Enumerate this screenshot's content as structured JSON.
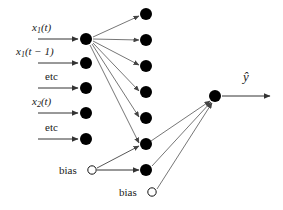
{
  "figure": {
    "type": "neural-network-diagram",
    "background_color": "#ffffff",
    "node_fill_color": "#000000",
    "bias_fill_color": "#ffffff",
    "edge_color": "#555555",
    "text_color": "#1a1a1a"
  },
  "input_layer": {
    "node_count": 5,
    "node_x": 86,
    "nodes": [
      {
        "label_main": "x",
        "label_sub": "1",
        "label_tail": "(t)",
        "y": 39,
        "arrow_from_x": 38,
        "arrow_to_x": 79,
        "label_x": 32,
        "label_y": 22
      },
      {
        "label_main": "x",
        "label_sub": "1",
        "label_tail": "(t − 1)",
        "y": 63,
        "arrow_from_x": 38,
        "arrow_to_x": 79,
        "label_x": 16,
        "label_y": 46
      },
      {
        "label_main": "etc",
        "label_sub": "",
        "label_tail": "",
        "y": 88,
        "arrow_from_x": 38,
        "arrow_to_x": 79,
        "label_x": 45,
        "label_y": 71
      },
      {
        "label_main": "x",
        "label_sub": "2",
        "label_tail": "(t)",
        "y": 113,
        "arrow_from_x": 38,
        "arrow_to_x": 79,
        "label_x": 32,
        "label_y": 96
      },
      {
        "label_main": "etc",
        "label_sub": "",
        "label_tail": "",
        "y": 139,
        "arrow_from_x": 38,
        "arrow_to_x": 79,
        "label_x": 45,
        "label_y": 122
      }
    ]
  },
  "input_bias": {
    "label": "bias",
    "x": 92,
    "y": 170,
    "radius": 4,
    "label_x": 59,
    "label_y": 165
  },
  "hidden_layer": {
    "node_count": 7,
    "node_x": 146,
    "node_y": [
      14,
      40,
      66,
      92,
      118,
      144,
      170
    ]
  },
  "output_bias": {
    "label": "bias",
    "x": 152,
    "y": 192,
    "radius": 4,
    "label_x": 119,
    "label_y": 187
  },
  "output_layer": {
    "node_x": 215,
    "node_y": 96,
    "label": "ŷ",
    "label_x": 243,
    "label_y": 72,
    "arrow_from_x": 222,
    "arrow_to_x": 271,
    "arrow_y": 96
  },
  "connections": {
    "input1_to_hidden_count": 7,
    "input_bias_to_hidden_index": 5,
    "hidden_to_output_indices": [
      5,
      6
    ],
    "output_bias_to_output": true
  }
}
